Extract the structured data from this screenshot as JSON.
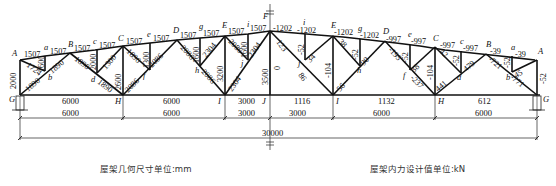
{
  "left_half": {
    "caption": "屋架几何尺寸单位:mm",
    "top_chord_segments": [
      "1507",
      "1507",
      "1507",
      "1507",
      "1507",
      "1507",
      "1507",
      "1507",
      "1507",
      "1507"
    ],
    "verticals": {
      "A_G": "2000",
      "a": "1600",
      "c": "2000",
      "C_H": "2600",
      "e": "1300",
      "g": "1600",
      "E_I": "3200",
      "i": "1600",
      "F_J": "3500"
    },
    "diagonals": {
      "A_b": "1724",
      "G_b": "1890",
      "b_B": "1890",
      "B_d": "1890",
      "d_H": "1890",
      "c_d": "1300",
      "C_f": "1890",
      "H_f": "2086",
      "f_D": "2086",
      "D_h": "2086",
      "h_I": "2086",
      "g_h": "2304",
      "E_j": "2086",
      "I_j": "2304",
      "j_F": "2304"
    },
    "bottom_chord": [
      "6000",
      "6000",
      "3000"
    ]
  },
  "right_half": {
    "caption": "屋架内力设计值单位:kN",
    "top_chord_forces": [
      "-1202",
      "-1202",
      "-1202",
      "-1202",
      "-997",
      "-997",
      "-997",
      "-997",
      "-39",
      "-39"
    ],
    "verticals": {
      "F_J": "0",
      "i": "-52",
      "E_I": "-104",
      "g": "-52",
      "e": "-52",
      "C_H": "-104",
      "c": "-52",
      "a": "-52",
      "A_G": "-52"
    },
    "diagonals": {
      "F_j": "123",
      "j_E": "34",
      "j_I": "86",
      "E_h": "38",
      "h_I": "56",
      "h_D": "90",
      "D_f": "-195",
      "f_e": "38",
      "f_H": "-237",
      "C_d": "42",
      "H_d": "441",
      "d_B": "479",
      "B_b": "-721",
      "b_G": "-771",
      "b_A": "45"
    },
    "bottom_chord_forces": [
      "1116",
      "1132",
      "612"
    ]
  },
  "nodes": {
    "top": [
      "A",
      "a",
      "B",
      "c",
      "C",
      "e",
      "D",
      "g",
      "E",
      "i",
      "F"
    ],
    "bottom": [
      "G",
      "H",
      "I",
      "J"
    ],
    "interior": [
      "b",
      "d",
      "f",
      "h",
      "j"
    ]
  },
  "dimensions": {
    "row1": [
      "6000",
      "6000",
      "3000",
      "3000",
      "6000",
      "6000"
    ],
    "total": "30000"
  }
}
